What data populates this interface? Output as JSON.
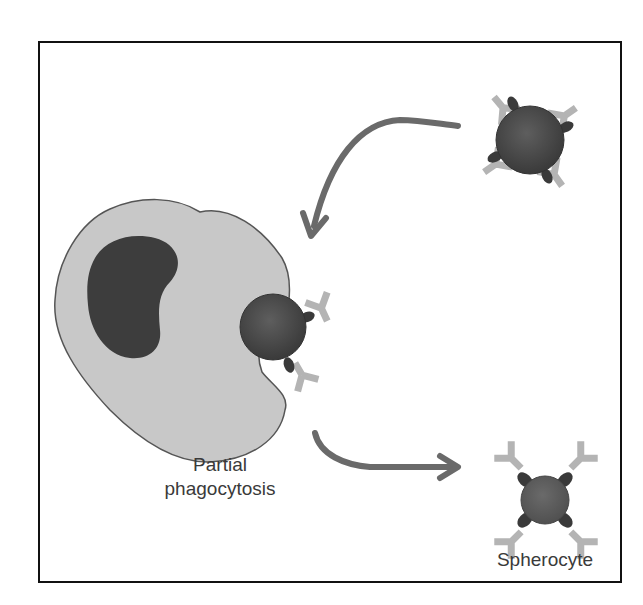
{
  "figure": {
    "labels": {
      "partial_phagocytosis_line1": "Partial",
      "partial_phagocytosis_line2": "phagocytosis",
      "spherocyte": "Spherocyte"
    },
    "elements": [
      {
        "name": "macrophage",
        "description": "Large irregular light-gray cell with dark kidney-shaped nucleus"
      },
      {
        "name": "antibody-coated-red-cell",
        "description": "Dark sphere with attached Y-shaped antibodies, top right"
      },
      {
        "name": "cell-being-phagocytosed",
        "description": "Dark sphere partially engulfed at macrophage edge"
      },
      {
        "name": "spherocyte",
        "description": "Smaller sphere with antibodies, bottom right"
      },
      {
        "name": "arrow-to-macrophage",
        "description": "Curved arrow from top-right cell toward macrophage"
      },
      {
        "name": "arrow-to-spherocyte",
        "description": "Curved arrow from macrophage toward spherocyte"
      }
    ],
    "colors": {
      "frame": "#111111",
      "macrophage_fill": "#c8c8c8",
      "macrophage_outline": "#555555",
      "nucleus": "#3d3d3d",
      "cell_dark": "#454545",
      "spherocyte_fill": "#5a5a5a",
      "antibody": "#b4b4b4",
      "receptor": "#3a3a3a",
      "arrow": "#6a6a6a",
      "text": "#3a3a3a"
    }
  }
}
